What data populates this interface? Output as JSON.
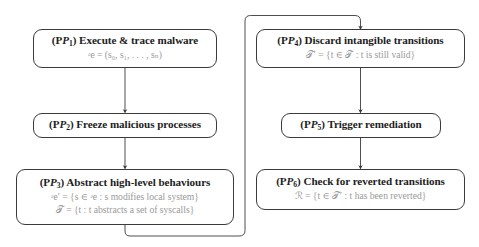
{
  "diagram": {
    "type": "flowchart",
    "title": "",
    "stroke_color": "#3b3b3b",
    "title_color": "#1d1d1d",
    "math_color": "#9a9a9a",
    "background": "#ffffff",
    "nodes": [
      {
        "id": "P1",
        "tag": "(P",
        "tag_sub": "1",
        "tag_close": ")",
        "title": "Execute & trace malware",
        "math": [
          "ᵊe = (s₀, s₁, . . . , sₙ)"
        ]
      },
      {
        "id": "P2",
        "tag": "(P",
        "tag_sub": "2",
        "tag_close": ")",
        "title": "Freeze malicious processes",
        "math": []
      },
      {
        "id": "P3",
        "tag": "(P",
        "tag_sub": "3",
        "tag_close": ")",
        "title": "Abstract high-level behaviours",
        "math": [
          "ᵊe′ = {s ∈ ᵊe : s modifies local system}",
          "𝒯 = {t : t abstracts a set of syscalls}"
        ]
      },
      {
        "id": "P4",
        "tag": "(P",
        "tag_sub": "4",
        "tag_close": ")",
        "title": "Discard intangible transitions",
        "math": [
          "𝒯′ = {t ∈ 𝒯 : t is still valid}"
        ]
      },
      {
        "id": "P5",
        "tag": "(P",
        "tag_sub": "5",
        "tag_close": ")",
        "title": "Trigger remediation",
        "math": []
      },
      {
        "id": "P6",
        "tag": "(P",
        "tag_sub": "6",
        "tag_close": ")",
        "title": "Check for reverted transitions",
        "math": [
          "ℛ = {t ∈ 𝒯′ : t has been reverted}"
        ]
      }
    ],
    "edges": [
      {
        "from": "P1",
        "to": "P2",
        "style": "straight-down-arrow"
      },
      {
        "from": "P2",
        "to": "P3",
        "style": "straight-down-arrow"
      },
      {
        "from": "P3",
        "to": "P4",
        "style": "wrap-around-right-up-arrow"
      },
      {
        "from": "P4",
        "to": "P5",
        "style": "straight-down-arrow"
      },
      {
        "from": "P5",
        "to": "P6",
        "style": "straight-down-arrow"
      }
    ]
  }
}
